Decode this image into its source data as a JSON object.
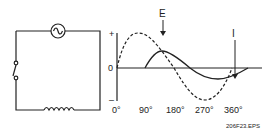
{
  "figure_id": "206F23.EPS",
  "circuit": {
    "components": [
      "ac-source",
      "switch",
      "inductor"
    ]
  },
  "graph": {
    "y_axis": {
      "plus": "+",
      "zero": "0",
      "minus": "–"
    },
    "x_ticks": [
      "0°",
      "90°",
      "180°",
      "270°",
      "360°"
    ],
    "curves": {
      "voltage": {
        "label": "E",
        "style": "dashed"
      },
      "current": {
        "label": "I",
        "style": "solid"
      }
    }
  }
}
